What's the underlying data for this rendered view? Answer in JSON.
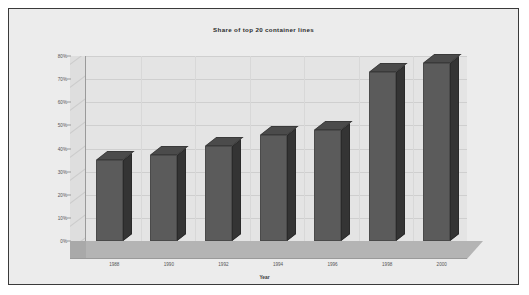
{
  "chart_data": {
    "type": "bar",
    "title": "Share of top 20 container lines",
    "xlabel": "Year",
    "ylabel": "",
    "categories": [
      "1988",
      "1990",
      "1992",
      "1994",
      "1996",
      "1998",
      "2000"
    ],
    "values": [
      35,
      37,
      41,
      46,
      48,
      73,
      77
    ],
    "ylim": [
      0,
      80
    ],
    "ytick_labels": [
      "0%",
      "10%",
      "20%",
      "30%",
      "40%",
      "50%",
      "60%",
      "70%",
      "80%"
    ],
    "ytick_values": [
      0,
      10,
      20,
      30,
      40,
      50,
      60,
      70,
      80
    ],
    "grid": true,
    "legend": false,
    "style": "3d-column",
    "colors": {
      "bar_front": "#5b5b5b",
      "bar_side": "#343434",
      "bar_top": "#4b4b4b",
      "plot_background": "#e4e4e4",
      "floor": "#b4b4b4",
      "frame_background": "#ececec",
      "frame_border": "#3a3a3a",
      "gridline": "#cfcfcf",
      "axis": "#9a9a9a",
      "text": "#555555",
      "title_text": "#2b2b2b"
    }
  }
}
